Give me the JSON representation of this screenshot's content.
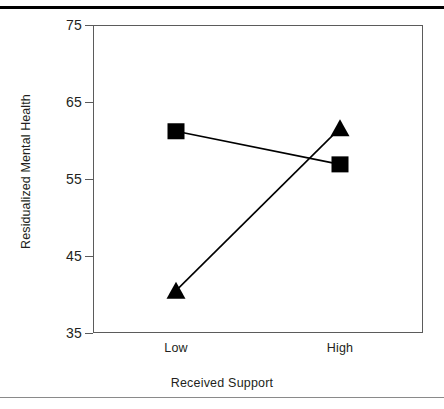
{
  "chart_data": {
    "type": "line",
    "title": "",
    "xlabel": "Received Support",
    "ylabel": "Residualized Mental Health",
    "categories": [
      "Low",
      "High"
    ],
    "x_tick_labels": [
      "Low",
      "High"
    ],
    "y_tick_labels": [
      "75",
      "65",
      "55",
      "45",
      "35"
    ],
    "y_ticks": [
      75,
      65,
      55,
      45,
      35
    ],
    "ylim": [
      35,
      75
    ],
    "grid": false,
    "legend": "none",
    "series": [
      {
        "name": "square-series",
        "marker": "square",
        "color": "#000000",
        "values": [
          61.2,
          56.9
        ]
      },
      {
        "name": "triangle-series",
        "marker": "triangle",
        "color": "#000000",
        "values": [
          40.5,
          61.6
        ]
      }
    ]
  },
  "figure": {
    "axis_color": "#5b5b5b",
    "text_color": "#231f20",
    "marker_color": "#000000",
    "background": "#ffffff",
    "top_rule_color": "#000000",
    "bottom_rule_color": "#8a8a8a"
  }
}
